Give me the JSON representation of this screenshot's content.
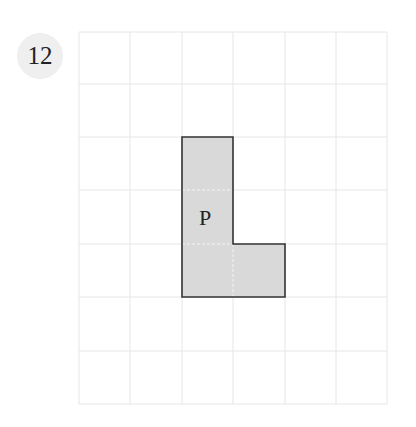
{
  "question_number": "12",
  "grid": {
    "columns": 6,
    "rows": 7,
    "line_color": "#e6e6e6"
  },
  "shape": {
    "label": "P",
    "fill": "#d9d9d9",
    "stroke": "#333333",
    "cells": [
      [
        2,
        2
      ],
      [
        2,
        3
      ],
      [
        2,
        4
      ],
      [
        3,
        4
      ]
    ]
  }
}
